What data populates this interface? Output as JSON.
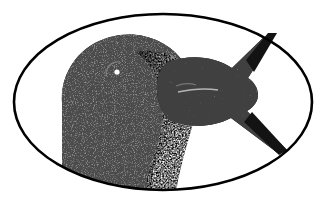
{
  "figure": {
    "description": "Monochrome halftone engraving of a penguin head in profile facing right, holding a fish in its beak, framed by a thin oval outline.",
    "style": "halftone-stipple-engraving",
    "medium": "black and white line and stipple illustration",
    "canvas": {
      "width": 327,
      "height": 203,
      "background_color": "#ffffff"
    },
    "colors": {
      "ink": "#111111",
      "outline": "#000000",
      "paper": "#ffffff",
      "midtone_dark": "#2b2b2b",
      "midtone_mid": "#585858",
      "speckle_light": "#e8e8e8"
    },
    "frame": {
      "shape": "ellipse",
      "center_x": 163,
      "center_y": 102,
      "radius_x": 150,
      "radius_y": 89,
      "stroke_width": 2.6,
      "stroke_color": "#000000",
      "fill": "none"
    },
    "elements": [
      {
        "name": "penguin-head",
        "label": "Penguin head",
        "tone": "dark",
        "position": "left",
        "notes": "Rounded crown, dark plumage rendered in dense stipple, clipped by the lower-left of the oval frame."
      },
      {
        "name": "cheek-patch",
        "label": "Cheek and throat patch",
        "tone": "light speckled",
        "position": "center",
        "notes": "Coarse white stipple forming the pale cheek fading into the dark head."
      },
      {
        "name": "eye-highlight",
        "label": "Eye highlight",
        "tone": "white glint",
        "position": "upper center-left",
        "cx": 117,
        "cy": 72,
        "r": 2.6
      },
      {
        "name": "beak",
        "label": "Beak",
        "tone": "dark",
        "position": "center-right",
        "notes": "Wedge-shaped dark beak pointing right, with a fine pale lateral highlight."
      },
      {
        "name": "fish",
        "label": "Fish held in beak",
        "tone": "dark",
        "position": "right",
        "notes": "Body gripped in the beak; forked caudal fin spreading beyond the right of the oval frame."
      },
      {
        "name": "fish-tail-upper-fin",
        "label": "Upper tail fin",
        "tip_x": 276,
        "tip_y": 34
      },
      {
        "name": "fish-tail-lower-fin",
        "label": "Lower tail fin",
        "tip_x": 286,
        "tip_y": 152
      }
    ]
  }
}
